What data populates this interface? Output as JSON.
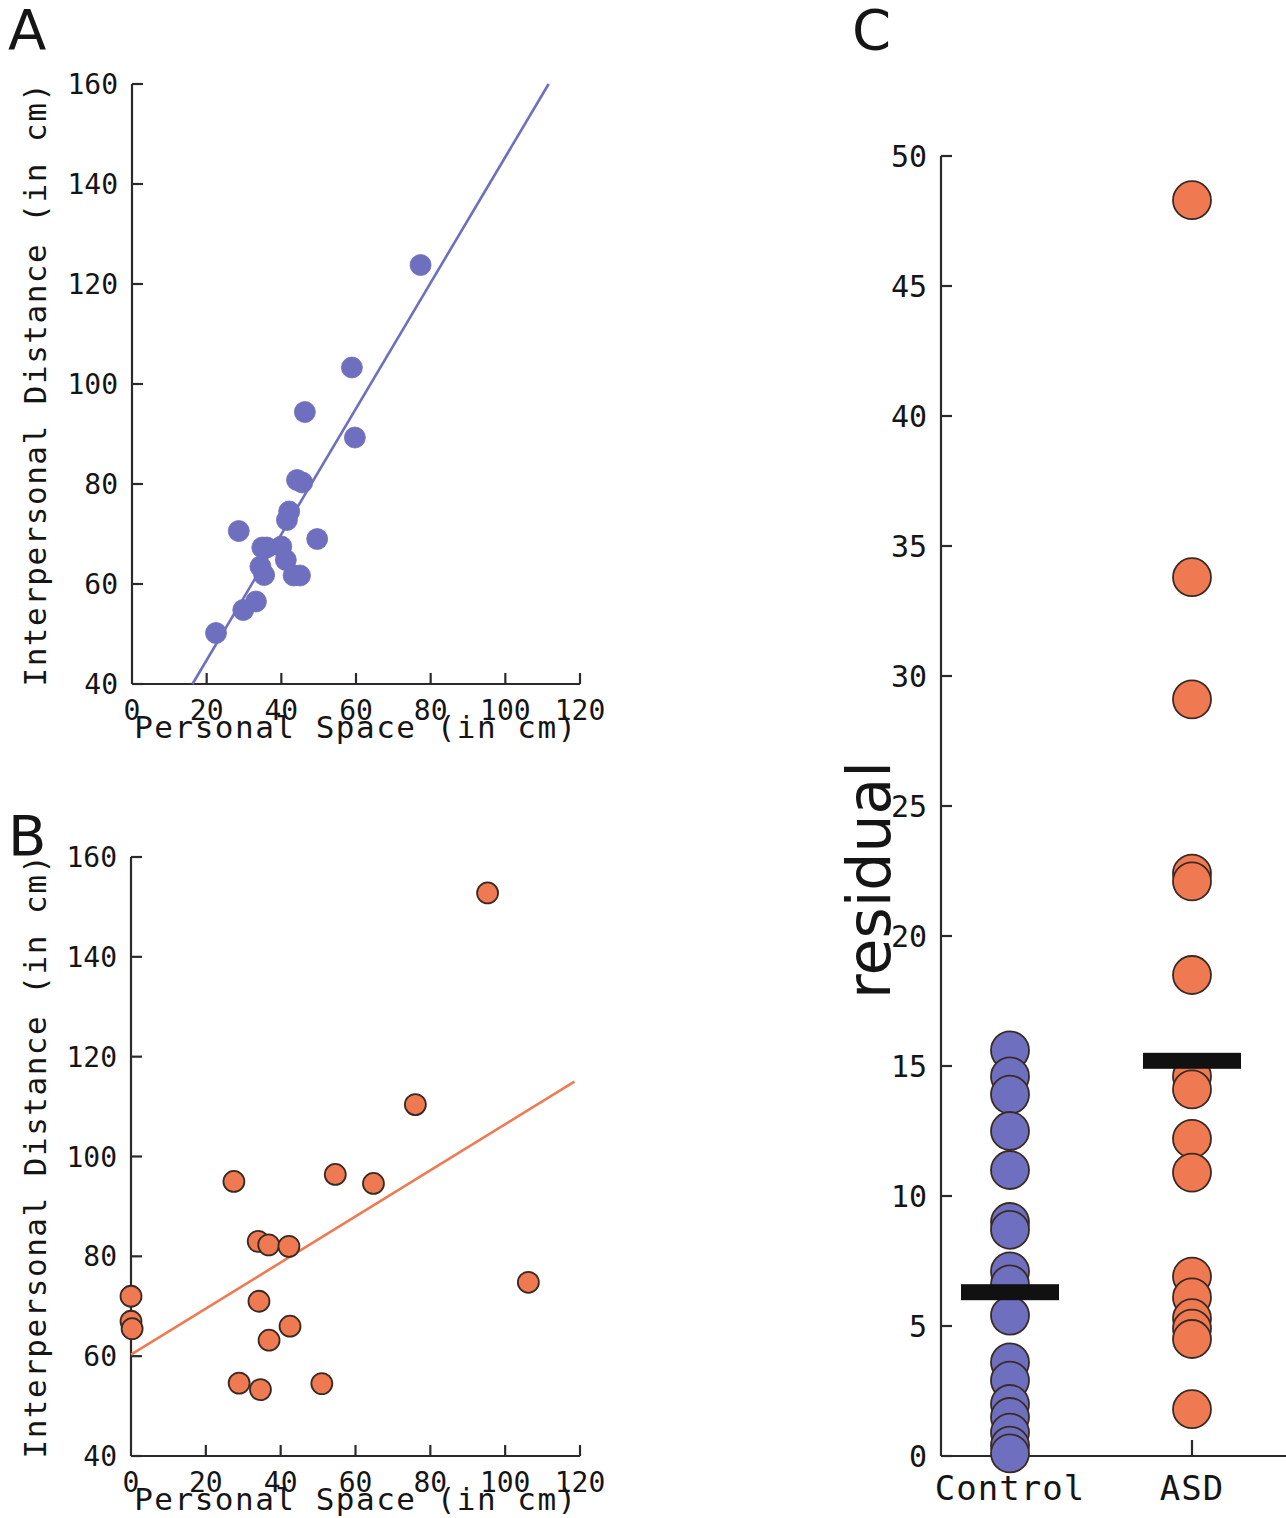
{
  "figure": {
    "panels": [
      {
        "id": "A",
        "letter": "A"
      },
      {
        "id": "B",
        "letter": "B"
      },
      {
        "id": "C",
        "letter": "C"
      }
    ]
  },
  "colors": {
    "control_blue": "#6f6fc0",
    "asd_orange": "#ef7a52",
    "marker_edge": "#3a2a24",
    "axis": "#2a2a2a",
    "mean_bar": "#111111",
    "text": "#151515"
  },
  "chart_data": [
    {
      "panel": "A",
      "type": "scatter",
      "title": "",
      "xlabel": "Personal Space (in cm)",
      "ylabel": "Interpersonal Distance (in cm)",
      "xlim": [
        0,
        120
      ],
      "ylim": [
        40,
        160
      ],
      "xticks": [
        0,
        20,
        40,
        60,
        80,
        100,
        120
      ],
      "yticks": [
        40,
        60,
        80,
        100,
        120,
        140,
        160
      ],
      "grid": false,
      "legend": "none",
      "series": [
        {
          "name": "Control",
          "color": "#6f6fc0",
          "points": [
            {
              "x": 22.5,
              "y": 50.2
            },
            {
              "x": 29.8,
              "y": 54.8
            },
            {
              "x": 33.2,
              "y": 56.5
            },
            {
              "x": 28.6,
              "y": 70.6
            },
            {
              "x": 34.4,
              "y": 63.5
            },
            {
              "x": 34.9,
              "y": 67.3
            },
            {
              "x": 36.1,
              "y": 67.3
            },
            {
              "x": 35.4,
              "y": 61.8
            },
            {
              "x": 40.0,
              "y": 67.5
            },
            {
              "x": 41.5,
              "y": 72.8
            },
            {
              "x": 42.1,
              "y": 74.5
            },
            {
              "x": 41.2,
              "y": 64.8
            },
            {
              "x": 43.3,
              "y": 61.7
            },
            {
              "x": 45.0,
              "y": 61.7
            },
            {
              "x": 44.2,
              "y": 80.8
            },
            {
              "x": 45.6,
              "y": 80.3
            },
            {
              "x": 46.3,
              "y": 94.4
            },
            {
              "x": 49.6,
              "y": 69.0
            },
            {
              "x": 58.9,
              "y": 103.3
            },
            {
              "x": 59.7,
              "y": 89.3
            },
            {
              "x": 77.3,
              "y": 123.8
            }
          ]
        }
      ],
      "fit_line": {
        "color": "#6f6fc0",
        "x_start": 16.2,
        "y_start": 40.0,
        "x_end": 111.6,
        "y_end": 160.0
      }
    },
    {
      "panel": "B",
      "type": "scatter",
      "title": "",
      "xlabel": "Personal Space (in cm)",
      "ylabel": "Interpersonal Distance (in cm)",
      "xlim": [
        0,
        120
      ],
      "ylim": [
        40,
        160
      ],
      "xticks": [
        0,
        20,
        40,
        60,
        80,
        100,
        120
      ],
      "yticks": [
        40,
        60,
        80,
        100,
        120,
        140,
        160
      ],
      "grid": false,
      "legend": "none",
      "series": [
        {
          "name": "ASD",
          "color": "#ef7a52",
          "points": [
            {
              "x": 0.0,
              "y": 72.0
            },
            {
              "x": 0.0,
              "y": 67.0
            },
            {
              "x": 0.3,
              "y": 65.5
            },
            {
              "x": 27.5,
              "y": 95.0
            },
            {
              "x": 28.9,
              "y": 54.6
            },
            {
              "x": 34.0,
              "y": 83.0
            },
            {
              "x": 34.2,
              "y": 71.0
            },
            {
              "x": 34.6,
              "y": 53.3
            },
            {
              "x": 36.8,
              "y": 82.3
            },
            {
              "x": 36.9,
              "y": 63.2
            },
            {
              "x": 42.2,
              "y": 82.0
            },
            {
              "x": 42.5,
              "y": 66.0
            },
            {
              "x": 51.0,
              "y": 54.5
            },
            {
              "x": 54.6,
              "y": 96.4
            },
            {
              "x": 64.8,
              "y": 94.6
            },
            {
              "x": 76.0,
              "y": 110.4
            },
            {
              "x": 95.3,
              "y": 152.8
            },
            {
              "x": 106.2,
              "y": 74.8
            }
          ]
        }
      ],
      "fit_line": {
        "color": "#ef7a52",
        "x_start": 0.0,
        "y_start": 60.3,
        "x_end": 118.5,
        "y_end": 115.0
      }
    },
    {
      "panel": "C",
      "type": "scatter",
      "title": "",
      "xlabel": "",
      "ylabel": "residual",
      "ylim": [
        0,
        50
      ],
      "yticks": [
        0,
        5,
        10,
        15,
        20,
        25,
        30,
        35,
        40,
        45,
        50
      ],
      "categories": [
        "Control",
        "ASD"
      ],
      "grid": false,
      "legend": "none",
      "series": [
        {
          "name": "Control",
          "color": "#6f6fc0",
          "values": [
            15.6,
            14.6,
            13.9,
            12.5,
            11.0,
            9.0,
            8.7,
            7.1,
            6.6,
            5.4,
            3.6,
            2.9,
            2.0,
            1.5,
            0.9,
            0.4,
            0.1
          ],
          "mean": 6.3
        },
        {
          "name": "ASD",
          "color": "#ef7a52",
          "values": [
            48.3,
            33.8,
            29.1,
            22.4,
            22.1,
            18.5,
            14.6,
            14.1,
            12.2,
            10.9,
            6.9,
            6.1,
            5.3,
            4.9,
            4.5,
            1.8
          ],
          "mean": 15.2
        }
      ]
    }
  ],
  "panelA": {
    "letter": "A",
    "xlabel": "Personal Space (in cm)",
    "ylabel": "Interpersonal Distance (in cm)",
    "xticklabels": [
      "0",
      "20",
      "40",
      "60",
      "80",
      "100",
      "120"
    ],
    "yticklabels": [
      "40",
      "60",
      "80",
      "100",
      "120",
      "140",
      "160"
    ]
  },
  "panelB": {
    "letter": "B",
    "xlabel": "Personal Space (in cm)",
    "ylabel": "Interpersonal Distance (in cm)",
    "xticklabels": [
      "0",
      "20",
      "40",
      "60",
      "80",
      "100",
      "120"
    ],
    "yticklabels": [
      "40",
      "60",
      "80",
      "100",
      "120",
      "140",
      "160"
    ]
  },
  "panelC": {
    "letter": "C",
    "ylabel": "residual",
    "yticklabels": [
      "0",
      "5",
      "10",
      "15",
      "20",
      "25",
      "30",
      "35",
      "40",
      "45",
      "50"
    ],
    "catlabels": [
      "Control",
      "ASD"
    ]
  }
}
